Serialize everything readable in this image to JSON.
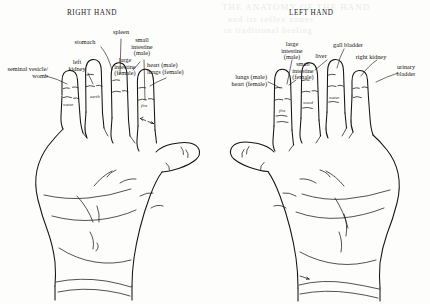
{
  "figure": {
    "caption_none": "",
    "ink_color": "#141414",
    "background_color": "#fdfdfb"
  },
  "panels": [
    {
      "id": "right-hand",
      "title": "RIGHT HAND",
      "organ_labels": [
        {
          "id": "seminal-vesicle-womb",
          "text": "seminal vesicle/\nwomb"
        },
        {
          "id": "left-kidney",
          "text": "left\nkidney"
        },
        {
          "id": "stomach",
          "text": "stomach"
        },
        {
          "id": "spleen",
          "text": "spleen"
        },
        {
          "id": "small-intestine-male",
          "text": "small\nintestine\n(male)"
        },
        {
          "id": "large-intestine-female",
          "text": "large\nintestine\n(female)"
        },
        {
          "id": "heart-male-lungs-female",
          "text": "heart (male)\nlungs (female)"
        }
      ],
      "element_labels": [
        {
          "id": "water",
          "text": "water"
        },
        {
          "id": "earth",
          "text": "earth"
        },
        {
          "id": "fire",
          "text": "fire"
        }
      ]
    },
    {
      "id": "left-hand",
      "title": "LEFT HAND",
      "organ_labels": [
        {
          "id": "lungs-male-heart-female",
          "text": "lungs (male)\nheart (female)"
        },
        {
          "id": "large-intestine-male",
          "text": "large\nintestine\n(male)"
        },
        {
          "id": "small-intestine-female",
          "text": "small\nintestine\n(female)"
        },
        {
          "id": "liver",
          "text": "liver"
        },
        {
          "id": "gall-bladder",
          "text": "gall bladder"
        },
        {
          "id": "right-kidney",
          "text": "right kidney"
        },
        {
          "id": "urinary-bladder",
          "text": "urinary\nbladder"
        }
      ],
      "element_labels": [
        {
          "id": "fire",
          "text": "fire"
        },
        {
          "id": "wood",
          "text": "wood"
        },
        {
          "id": "water",
          "text": "water"
        }
      ]
    }
  ],
  "bleedthrough": {
    "line1": "THE ANATOMY OF THE HAND",
    "line2": "and its reflex zones",
    "line3": "in traditional healing"
  }
}
